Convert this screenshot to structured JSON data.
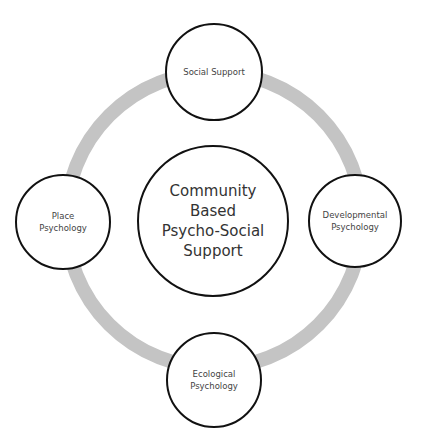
{
  "diagram": {
    "type": "cycle",
    "ring_color": "#c4c4c4",
    "center": {
      "lines": [
        "Community",
        "Based",
        "Psycho-Social",
        "Support"
      ]
    },
    "nodes": [
      {
        "position": "top",
        "lines": [
          "Social Support"
        ]
      },
      {
        "position": "right",
        "lines": [
          "Developmental",
          "Psychology"
        ]
      },
      {
        "position": "bottom",
        "lines": [
          "Ecological",
          "Psychology"
        ]
      },
      {
        "position": "left",
        "lines": [
          "Place",
          "Psychology"
        ]
      }
    ]
  }
}
